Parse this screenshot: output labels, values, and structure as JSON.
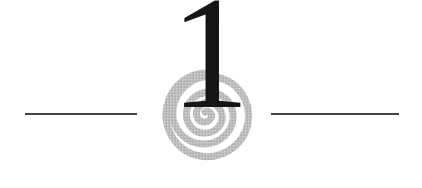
{
  "chapter": {
    "number": "1"
  },
  "colors": {
    "numeral": "#151515",
    "rule": "#444444",
    "spiral": "#b8b8b8",
    "background": "#ffffff"
  },
  "icons": {
    "spiral": "spiral-icon"
  }
}
